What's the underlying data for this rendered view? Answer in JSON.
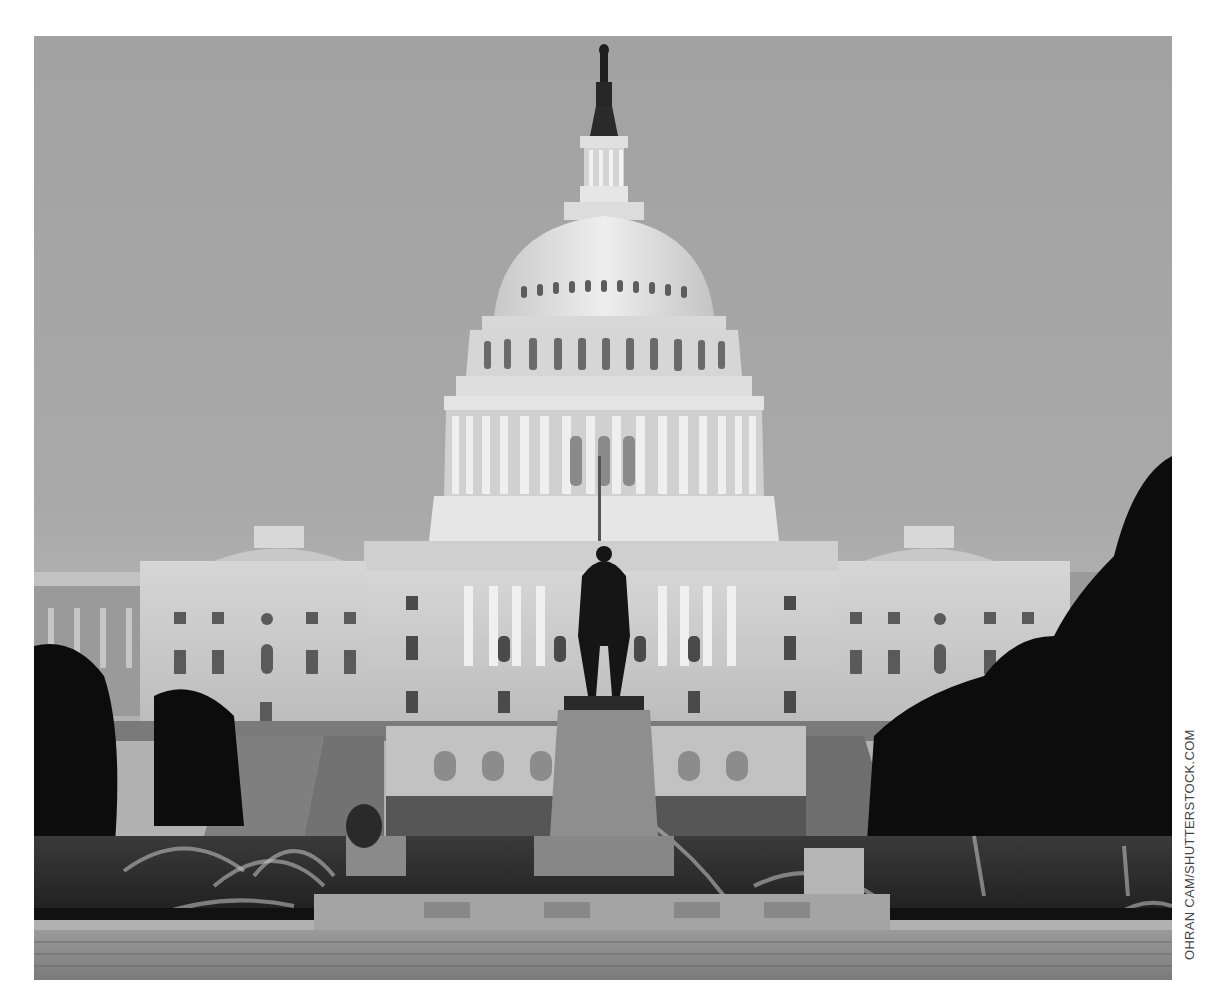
{
  "photo": {
    "subject": "United States Capitol building at dusk with equestrian statue and fountains",
    "tone": "grayscale",
    "colors": {
      "sky": "#a6a6a6",
      "building": "#d2d2d2",
      "dome": "#e4e4e4",
      "trees": "#0d0d0d",
      "lawn": "#2a2a2a",
      "foreground_stone": "#8f8f8f"
    }
  },
  "credit": {
    "text": "OHRAN CAM/SHUTTERSTOCK.COM"
  }
}
